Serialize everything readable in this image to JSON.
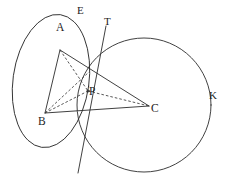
{
  "figure": {
    "type": "geometry-diagram",
    "background_color": "#ffffff",
    "ink_color": "#2b2b2b",
    "width": 232,
    "height": 180
  },
  "labels": {
    "vertex_a": "A",
    "vertex_b": "B",
    "vertex_c": "C",
    "point_p": "P",
    "ellipse_e": "E",
    "tangent_t": "T",
    "circle_k": "K"
  },
  "points": {
    "A": {
      "x": 60,
      "y": 50
    },
    "B": {
      "x": 45,
      "y": 113
    },
    "C": {
      "x": 149,
      "y": 106
    },
    "P": {
      "x": 88,
      "y": 91
    },
    "Q": {
      "x": 89,
      "y": 72
    }
  },
  "label_positions": {
    "A": {
      "x": 60,
      "y": 36
    },
    "B": {
      "x": 41,
      "y": 121
    },
    "C": {
      "x": 152,
      "y": 107
    },
    "P": {
      "x": 90,
      "y": 89
    },
    "E": {
      "x": 79,
      "y": 9
    },
    "T": {
      "x": 105,
      "y": 21
    },
    "K": {
      "x": 210,
      "y": 94
    }
  },
  "shapes": {
    "ellipse": {
      "name": "ellipse-E",
      "center_x": 51,
      "center_y": 81,
      "radius_x": 38,
      "radius_y": 67,
      "rotation_deg": 8
    },
    "circle": {
      "name": "circle-K",
      "center_x": 144,
      "center_y": 105,
      "radius": 67
    },
    "tangent_line": {
      "name": "line-T",
      "x1": 106,
      "y1": 26,
      "x2": 78,
      "y2": 173
    }
  },
  "segments": {
    "solid": [
      {
        "name": "segment-AB",
        "from": "A",
        "to": "B"
      },
      {
        "name": "segment-BC",
        "from": "B",
        "to": "C"
      },
      {
        "name": "segment-AC",
        "from": "A",
        "to": "C"
      }
    ],
    "dashed": [
      {
        "name": "segment-AP",
        "from": "A",
        "to": "P"
      },
      {
        "name": "segment-BP",
        "from": "B",
        "to": "P"
      },
      {
        "name": "segment-PC",
        "from": "P",
        "to": "C"
      },
      {
        "name": "segment-BQ",
        "from": "B",
        "to": "Q"
      }
    ]
  }
}
